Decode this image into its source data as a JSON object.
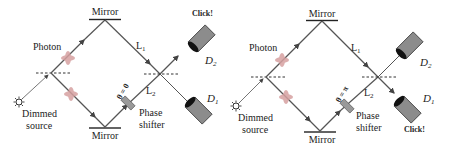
{
  "panels": [
    {
      "id": "left",
      "phase_label": "θ = 0",
      "labels": {
        "mirror_top": "Mirror",
        "mirror_bottom": "Mirror",
        "photon": "Photon",
        "source_line1": "Dimmed",
        "source_line2": "source",
        "path1": "L",
        "path1_sub": "1",
        "path2": "L",
        "path2_sub": "2",
        "shifter_line1": "Phase",
        "shifter_line2": "shifter",
        "detector_upper": "D",
        "detector_upper_sub": "2",
        "detector_lower": "D",
        "detector_lower_sub": "1",
        "click": "Click!"
      },
      "clicking_detector": "D2"
    },
    {
      "id": "right",
      "phase_label": "θ = π",
      "labels": {
        "mirror_top": "Mirror",
        "mirror_bottom": "Mirror",
        "photon": "Photon",
        "source_line1": "Dimmed",
        "source_line2": "source",
        "path1": "L",
        "path1_sub": "1",
        "path2": "L",
        "path2_sub": "2",
        "shifter_line1": "Phase",
        "shifter_line2": "shifter",
        "detector_upper": "D",
        "detector_upper_sub": "2",
        "detector_lower": "D",
        "detector_lower_sub": "1",
        "click": "Click!"
      },
      "clicking_detector": "D1"
    }
  ],
  "colors": {
    "beam": "#555555",
    "photon_blob": "#d9a3a3",
    "detector_body": "#8c8c8c",
    "detector_face": "#111111",
    "shifter": "#9a9a9a"
  }
}
